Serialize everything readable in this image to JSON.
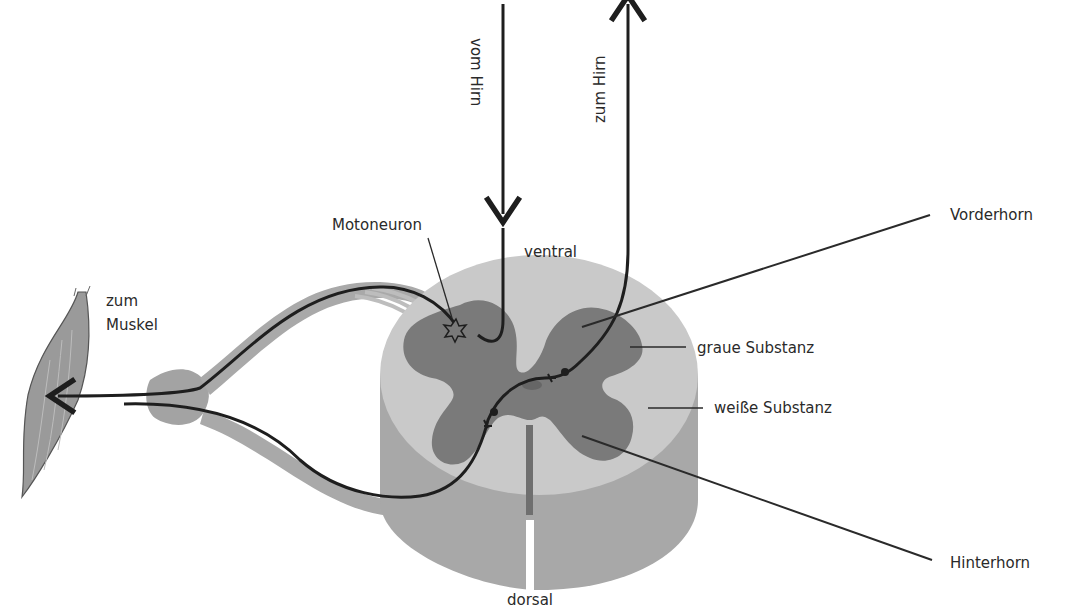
{
  "diagram": {
    "title": "",
    "labels": {
      "from_brain": "vom Hirn",
      "to_brain": "zum Hirn",
      "motoneuron": "Motoneuron",
      "ventral": "ventral",
      "dorsal": "dorsal",
      "to_muscle_line1": "zum",
      "to_muscle_line2": "Muskel",
      "anterior_horn": "Vorderhorn",
      "grey_matter": "graue Substanz",
      "white_matter": "weiße Substanz",
      "posterior_horn": "Hinterhorn"
    },
    "colors": {
      "white_matter": "#c9c9c9",
      "white_matter_side": "#a8a8a8",
      "grey_matter": "#7a7a7a",
      "nerve_root": "#a3a3a3",
      "muscle": "#9a9a9a",
      "pathway": "#1e1e1e",
      "text": "#2a2a2a"
    }
  }
}
